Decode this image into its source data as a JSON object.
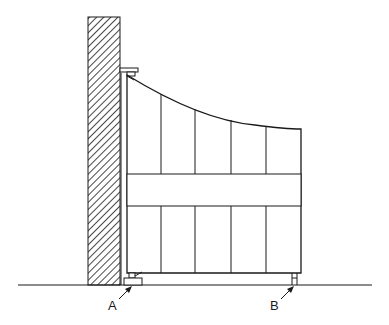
{
  "diagram": {
    "labels": {
      "a": "A",
      "b": "B"
    },
    "colors": {
      "line": "#1a1a1a",
      "background": "#ffffff"
    },
    "components": {
      "wall": "hatched-wall",
      "gate": "curved-top-gate",
      "boards": 5,
      "rail": "horizontal-rail",
      "top_hinge": "top-bracket",
      "bottom_pivot_a": "pivot-A",
      "bottom_wheel_b": "support-B",
      "ground": "ground-line"
    }
  }
}
